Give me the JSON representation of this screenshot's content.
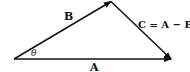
{
  "diagram": {
    "type": "vector-triangle",
    "vectors": [
      {
        "name": "A",
        "label": "A",
        "from": [
          14,
          59
        ],
        "to": [
          171,
          59
        ]
      },
      {
        "name": "B",
        "label": "B",
        "from": [
          14,
          59
        ],
        "to": [
          111,
          1
        ]
      },
      {
        "name": "C",
        "label": "C = A − B",
        "from": [
          111,
          1
        ],
        "to": [
          171,
          59
        ]
      }
    ],
    "angle": {
      "label": "θ",
      "between": [
        "A",
        "B"
      ]
    },
    "colors": {
      "stroke": "#111111",
      "background": "#ffffff"
    }
  }
}
